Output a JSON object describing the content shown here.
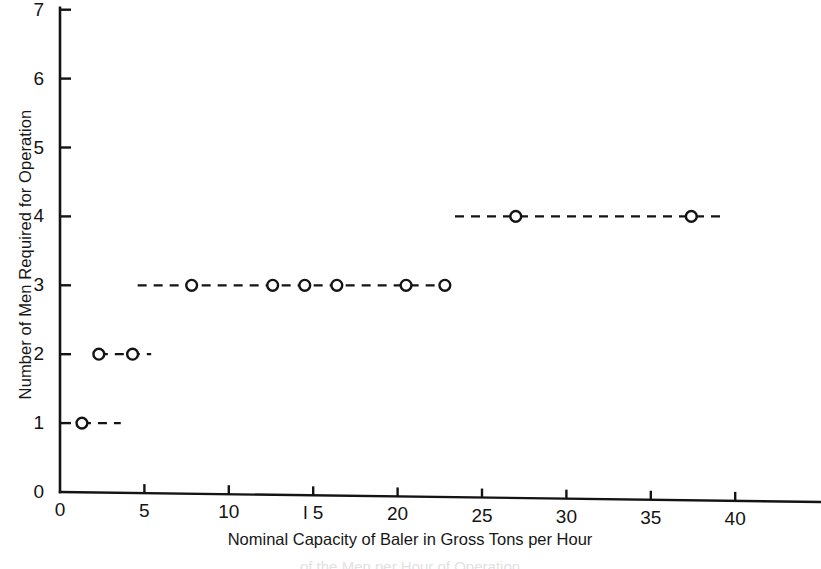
{
  "chart_data": {
    "type": "scatter",
    "title": "",
    "xlabel": "Nominal Capacity of Baler in Gross Tons per Hour",
    "ylabel": "Number of Men Required for Operation",
    "xlim": [
      0,
      45
    ],
    "ylim": [
      0,
      7
    ],
    "xticks": [
      0,
      5,
      10,
      15,
      20,
      25,
      30,
      35,
      40
    ],
    "xtick_labels": [
      "0",
      "5",
      "10",
      "l 5",
      "20",
      "25",
      "30",
      "35",
      "40"
    ],
    "yticks": [
      0,
      1,
      2,
      3,
      4,
      5,
      6,
      7
    ],
    "ytick_labels": [
      "0",
      "1",
      "2",
      "3",
      "4",
      "5",
      "6",
      "7"
    ],
    "grid": false,
    "legend": null,
    "marker": "open-circle",
    "line_style": "dashed",
    "groups": [
      {
        "name": "one-man-crew",
        "y": 1,
        "x": [
          1.3
        ],
        "segment": [
          1.3,
          3.6
        ]
      },
      {
        "name": "two-man-crew",
        "y": 2,
        "x": [
          2.3,
          4.3
        ],
        "segment": [
          2.3,
          5.4
        ]
      },
      {
        "name": "three-man-crew",
        "y": 3,
        "x": [
          7.8,
          12.6,
          14.5,
          16.4,
          20.5,
          22.8
        ],
        "segment": [
          4.6,
          23.5
        ]
      },
      {
        "name": "four-man-crew",
        "y": 4,
        "x": [
          27.0,
          37.4
        ],
        "segment": [
          23.4,
          39.4
        ]
      }
    ],
    "points": [
      {
        "x": 1.3,
        "y": 1
      },
      {
        "x": 2.3,
        "y": 2
      },
      {
        "x": 4.3,
        "y": 2
      },
      {
        "x": 7.8,
        "y": 3
      },
      {
        "x": 12.6,
        "y": 3
      },
      {
        "x": 14.5,
        "y": 3
      },
      {
        "x": 16.4,
        "y": 3
      },
      {
        "x": 20.5,
        "y": 3
      },
      {
        "x": 22.8,
        "y": 3
      },
      {
        "x": 27.0,
        "y": 4
      },
      {
        "x": 37.4,
        "y": 4
      }
    ],
    "colors": {
      "axis": "#141414",
      "marker_stroke": "#141414",
      "marker_fill": "#ffffff",
      "line": "#141414",
      "background": "#ffffff"
    }
  },
  "caption": {
    "bottom_fragment": "of the Men per Hour of Operation"
  }
}
